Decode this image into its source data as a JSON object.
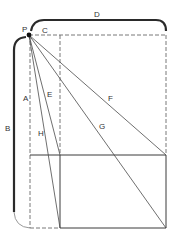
{
  "diagram": {
    "type": "perspective-geometry",
    "colors": {
      "line": "#3a3a3a",
      "dashed": "#6a6a6a",
      "background": "#ffffff"
    },
    "point": {
      "label": "P",
      "x": 29,
      "y": 35
    },
    "labels": {
      "P": "P",
      "C": "C",
      "D": "D",
      "A": "A",
      "B": "B",
      "E": "E",
      "F": "F",
      "G": "G",
      "H": "H"
    },
    "rays_from_P": [
      {
        "label": "E",
        "to": [
          60,
          155
        ]
      },
      {
        "label": "H",
        "to": [
          60,
          228
        ]
      },
      {
        "label": "F",
        "to": [
          166,
          155
        ]
      },
      {
        "label": "G",
        "to": [
          166,
          228
        ]
      }
    ],
    "brackets": [
      {
        "label": "D",
        "orientation": "horizontal",
        "span": [
          31,
          166
        ]
      },
      {
        "label": "B",
        "orientation": "vertical",
        "span": [
          37,
          228
        ]
      }
    ]
  }
}
